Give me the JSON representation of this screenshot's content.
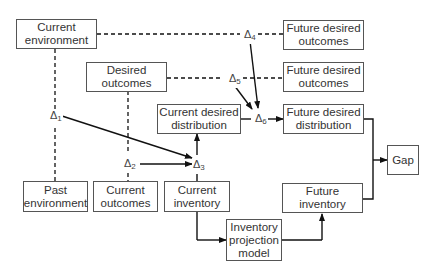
{
  "diagram": {
    "nodes": {
      "current_environment": "Current\nenvironment",
      "desired_outcomes": "Desired\noutcomes",
      "current_desired_distribution": "Current desired\ndistribution",
      "future_desired_outcomes_1": "Future desired\noutcomes",
      "future_desired_outcomes_2": "Future desired\noutcomes",
      "future_desired_distribution": "Future desired\ndistribution",
      "gap": "Gap",
      "past_environment": "Past\nenvironment",
      "current_outcomes": "Current\noutcomes",
      "current_inventory": "Current\ninventory",
      "future_inventory": "Future\ninventory",
      "inventory_projection_model": "Inventory\nprojection\nmodel"
    },
    "deltas": {
      "d1": {
        "symbol": "Δ",
        "sub": "1"
      },
      "d2": {
        "symbol": "Δ",
        "sub": "2"
      },
      "d3": {
        "symbol": "Δ",
        "sub": "3"
      },
      "d4": {
        "symbol": "Δ",
        "sub": "4"
      },
      "d5": {
        "symbol": "Δ",
        "sub": "5"
      },
      "d6": {
        "symbol": "Δ",
        "sub": "6"
      }
    },
    "edges": [
      {
        "from": "current_environment",
        "to": "past_environment",
        "style": "dashed",
        "via": "Δ1"
      },
      {
        "from": "Δ1",
        "to": "Δ3",
        "style": "arrow"
      },
      {
        "from": "desired_outcomes",
        "to": "current_outcomes",
        "style": "dashed",
        "via": "Δ2"
      },
      {
        "from": "Δ2",
        "to": "Δ3",
        "style": "arrow"
      },
      {
        "from": "current_inventory",
        "to": "Δ3",
        "style": "line"
      },
      {
        "from": "Δ3",
        "to": "current_desired_distribution",
        "style": "arrow"
      },
      {
        "from": "current_environment",
        "to": "future_desired_outcomes_1",
        "style": "dashed",
        "via": "Δ4"
      },
      {
        "from": "desired_outcomes",
        "to": "future_desired_outcomes_2",
        "style": "dashed",
        "via": "Δ5"
      },
      {
        "from": "Δ4",
        "to": "Δ6",
        "style": "arrow"
      },
      {
        "from": "Δ5",
        "to": "Δ6",
        "style": "arrow"
      },
      {
        "from": "current_desired_distribution",
        "to": "Δ6",
        "style": "line"
      },
      {
        "from": "Δ6",
        "to": "future_desired_distribution",
        "style": "arrow"
      },
      {
        "from": "current_inventory",
        "to": "inventory_projection_model",
        "style": "arrow"
      },
      {
        "from": "inventory_projection_model",
        "to": "future_inventory",
        "style": "arrow"
      },
      {
        "from": "future_desired_distribution",
        "to": "gap",
        "style": "arrow"
      },
      {
        "from": "future_inventory",
        "to": "gap",
        "style": "arrow"
      }
    ]
  }
}
